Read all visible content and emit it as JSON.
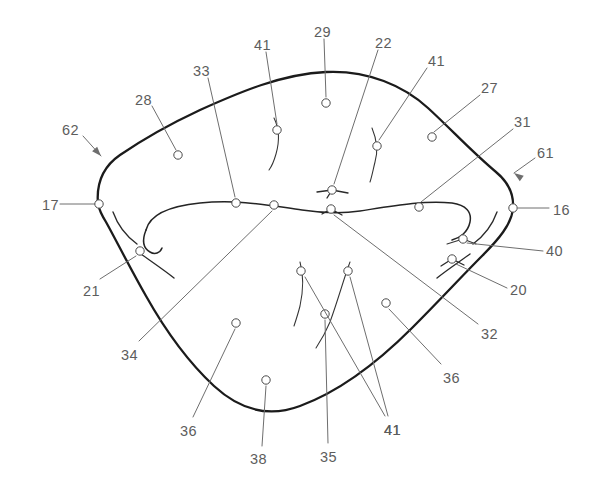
{
  "figure": {
    "width": 593,
    "height": 480,
    "background_color": "#ffffff",
    "outline_color": "#1b1b1b",
    "leader_color": "#6e6e6e",
    "label_color": "#5d5d5d",
    "callout_count": 24
  },
  "callouts": [
    {
      "id": "c17",
      "label": "17",
      "label_x": 42,
      "label_y": 198,
      "dot_x": 99,
      "dot_y": 204,
      "leader": "M 60 204 L 95 204",
      "style": "straight",
      "arrow": false
    },
    {
      "id": "c62",
      "label": "62",
      "label_x": 62,
      "label_y": 123,
      "dot_x": 105,
      "dot_y": 161,
      "leader": "M 83 136 L 101 156",
      "style": "arrow",
      "arrow": true,
      "arrow_angle": 48
    },
    {
      "id": "c28",
      "label": "28",
      "label_x": 135,
      "label_y": 93,
      "dot_x": 178,
      "dot_y": 155,
      "leader": "M 152 106 L 176 150",
      "style": "plain",
      "arrow": false
    },
    {
      "id": "c33",
      "label": "33",
      "label_x": 193,
      "label_y": 64,
      "dot_x": 236,
      "dot_y": 203,
      "leader": "M 208 78 L 235 197",
      "style": "plain",
      "arrow": false
    },
    {
      "id": "c41a",
      "label": "41",
      "label_x": 254,
      "label_y": 38,
      "dot_x": 277,
      "dot_y": 130,
      "leader": "M 266 52 L 277 124",
      "style": "plain",
      "arrow": false
    },
    {
      "id": "c29",
      "label": "29",
      "label_x": 314,
      "label_y": 25,
      "dot_x": 326,
      "dot_y": 103,
      "leader": "M 324 39 L 326 97",
      "style": "plain",
      "arrow": false
    },
    {
      "id": "c22",
      "label": "22",
      "label_x": 375,
      "label_y": 36,
      "dot_x": 332,
      "dot_y": 190,
      "leader": "M 378 50 L 334 184",
      "style": "plain",
      "arrow": false
    },
    {
      "id": "c41b",
      "label": "41",
      "label_x": 428,
      "label_y": 54,
      "dot_x": 377,
      "dot_y": 146,
      "leader": "M 427 68 L 379 140",
      "style": "plain",
      "arrow": false
    },
    {
      "id": "c27",
      "label": "27",
      "label_x": 481,
      "label_y": 81,
      "dot_x": 432,
      "dot_y": 137,
      "leader": "M 480 95 L 434 132",
      "style": "plain",
      "arrow": false
    },
    {
      "id": "c31",
      "label": "31",
      "label_x": 514,
      "label_y": 115,
      "dot_x": 419,
      "dot_y": 207,
      "leader": "M 513 129 L 421 202",
      "style": "plain",
      "arrow": false
    },
    {
      "id": "c61",
      "label": "61",
      "label_x": 537,
      "label_y": 146,
      "dot_x": 507,
      "dot_y": 163,
      "leader": "M 535 158 L 514 173",
      "style": "arrow",
      "arrow": true,
      "arrow_angle": 215
    },
    {
      "id": "c16",
      "label": "16",
      "label_x": 553,
      "label_y": 203,
      "dot_x": 513,
      "dot_y": 208,
      "leader": "M 518 208 L 549 208",
      "style": "straight",
      "arrow": false
    },
    {
      "id": "c40",
      "label": "40",
      "label_x": 546,
      "label_y": 244,
      "dot_x": 463,
      "dot_y": 239,
      "leader": "M 543 251 L 467 243",
      "style": "plain",
      "arrow": false
    },
    {
      "id": "c20",
      "label": "20",
      "label_x": 510,
      "label_y": 283,
      "dot_x": 452,
      "dot_y": 259,
      "leader": "M 507 288 L 456 264",
      "style": "plain",
      "arrow": false
    },
    {
      "id": "c32",
      "label": "32",
      "label_x": 481,
      "label_y": 327,
      "dot_x": 331,
      "dot_y": 209,
      "leader": "M 478 324 L 334 215",
      "style": "plain",
      "arrow": false
    },
    {
      "id": "c21",
      "label": "21",
      "label_x": 83,
      "label_y": 284,
      "dot_x": 140,
      "dot_y": 251,
      "leader": "M 100 279 L 136 256",
      "style": "plain",
      "arrow": false
    },
    {
      "id": "c34",
      "label": "34",
      "label_x": 121,
      "label_y": 348,
      "dot_x": 274,
      "dot_y": 205,
      "leader": "M 139 341 L 272 211",
      "style": "plain",
      "arrow": false
    },
    {
      "id": "c36a",
      "label": "36",
      "label_x": 180,
      "label_y": 424,
      "dot_x": 236,
      "dot_y": 323,
      "leader": "M 193 417 L 235 329",
      "style": "plain",
      "arrow": false
    },
    {
      "id": "c38",
      "label": "38",
      "label_x": 250,
      "label_y": 452,
      "dot_x": 266,
      "dot_y": 380,
      "leader": "M 262 446 L 266 386",
      "style": "plain",
      "arrow": false
    },
    {
      "id": "c35",
      "label": "35",
      "label_x": 320,
      "label_y": 450,
      "dot_x": 325,
      "dot_y": 314,
      "leader": "M 328 443 L 325 320",
      "style": "plain",
      "arrow": false
    },
    {
      "id": "c41c",
      "label": "41",
      "label_x": 384,
      "label_y": 423,
      "dot_x": 348,
      "dot_y": 271,
      "leader": "M 388 416 L 350 277",
      "style": "plain",
      "arrow": false
    },
    {
      "id": "c41d",
      "label": "41",
      "label_x": 384,
      "label_y": 423,
      "dot_x": 301,
      "dot_y": 271,
      "leader": "M 385 416 L 305 277",
      "style": "plain",
      "arrow": false
    },
    {
      "id": "c36b",
      "label": "36",
      "label_x": 443,
      "label_y": 371,
      "dot_x": 386,
      "dot_y": 303,
      "leader": "M 441 364 L 389 309",
      "style": "plain",
      "arrow": false
    }
  ],
  "outline": {
    "name": "outer-boundary",
    "path": "M 98 204 C 96 182 104 166 120 155 C 142 140 170 124 200 110 C 240 92 282 74 326 72 C 368 70 404 86 428 108 C 452 130 472 152 496 172 C 508 182 514 194 513 208 C 512 224 498 240 482 256 C 462 276 440 300 412 328 C 378 362 338 392 300 406 C 268 418 240 410 214 386 C 186 360 164 328 146 296 C 130 268 116 240 106 222 C 101 214 99 209 98 204 Z"
  },
  "inner_curve": {
    "name": "inner-dividing-curve",
    "path": "M 146 230 C 150 214 170 206 200 203 C 240 199 272 206 302 210 C 322 213 340 214 360 211 C 392 206 424 200 452 203 C 466 205 472 212 470 222 C 468 232 460 238 452 240"
  },
  "inner_curve_left_tail": {
    "name": "inner-curve-left-tail",
    "path": "M 146 230 C 142 240 143 248 150 252 C 155 255 160 253 162 248"
  },
  "ticks": [
    {
      "id": "t-left-upper",
      "name": "tick-mark-left-upper",
      "path": "M 113 212 C 118 226 126 236 137 244"
    },
    {
      "id": "t-left-lower",
      "name": "tick-mark-left-lower",
      "path": "M 141 254 C 152 262 164 270 174 278"
    },
    {
      "id": "t-right-upper",
      "name": "tick-mark-right-upper",
      "path": "M 497 212 C 492 226 484 236 473 244"
    },
    {
      "id": "t-right-lower",
      "name": "tick-mark-right-lower",
      "path": "M 470 254 C 459 262 447 270 437 278"
    },
    {
      "id": "t-41a",
      "name": "wavy-tick-41-top-left",
      "path": "M 274 118 C 279 128 280 140 276 154 C 274 161 272 166 269 170"
    },
    {
      "id": "t-41b",
      "name": "wavy-tick-41-top-right",
      "path": "M 372 128 C 377 140 378 152 375 162 C 373 170 372 176 370 182"
    },
    {
      "id": "t-22",
      "name": "three-prong-mark-22",
      "path": "M 317 192 L 332 190 M 332 190 L 348 193 M 332 190 L 327 198"
    },
    {
      "id": "t-40",
      "name": "prong-mark-40",
      "path": "M 447 244 L 463 239 M 463 239 L 476 244"
    },
    {
      "id": "t-20",
      "name": "prong-mark-20",
      "path": "M 441 266 L 452 259 M 452 259 L 464 265"
    },
    {
      "id": "t-41c",
      "name": "wavy-tick-41-bot-left",
      "path": "M 300 262 C 304 276 303 292 300 306 C 298 314 296 320 294 326"
    },
    {
      "id": "t-41d",
      "name": "wavy-tick-41-bot-right",
      "path": "M 350 262 C 344 278 338 300 330 322 C 325 334 320 342 316 348"
    },
    {
      "id": "t-32",
      "name": "prong-mark-32",
      "path": "M 322 214 L 331 209 M 331 209 L 342 215"
    }
  ]
}
